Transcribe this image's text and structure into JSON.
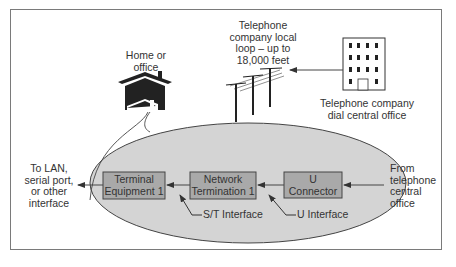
{
  "diagram": {
    "title": "",
    "colors": {
      "ellipse_fill": "#d4d4d4",
      "box_fill": "#a9a9a9",
      "line": "#333333",
      "text": "#333333"
    },
    "nodes": {
      "home": {
        "label": "Home or\noffice",
        "icon": "house-icon"
      },
      "local_loop": {
        "label": "Telephone\ncompany local\nloop – up to\n18,000 feet",
        "icon": "telephone-poles-icon"
      },
      "central_office": {
        "label": "Telephone company\ndial central office",
        "icon": "office-building-icon"
      },
      "lan_output": {
        "label": "To LAN,\nserial port,\nor other\ninterface"
      },
      "terminal_equipment": {
        "label": "Terminal\nEquipment 1"
      },
      "network_termination": {
        "label": "Network\nTermination 1"
      },
      "u_connector": {
        "label": "U\nConnector"
      },
      "from_central": {
        "label": "From\ntelephone\ncentral\noffice"
      },
      "st_interface": {
        "label": "S/T Interface"
      },
      "u_interface": {
        "label": "U Interface"
      }
    },
    "edges": [
      {
        "from": "central_office",
        "to": "local_loop"
      },
      {
        "from": "from_central",
        "to": "u_connector"
      },
      {
        "from": "u_connector",
        "to": "network_termination"
      },
      {
        "from": "network_termination",
        "to": "terminal_equipment"
      },
      {
        "from": "terminal_equipment",
        "to": "lan_output"
      },
      {
        "from": "st_interface",
        "to": "terminal_equipment"
      },
      {
        "from": "u_interface",
        "to": "network_termination"
      }
    ]
  }
}
